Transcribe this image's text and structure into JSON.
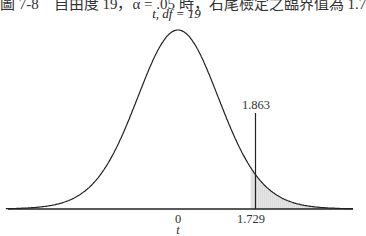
{
  "caption": "圖 7-8　自由度 19，α = .05 時，右尾檢定之臨界值為 1.7",
  "chart_data": {
    "type": "area",
    "title": "t, df = 19",
    "distribution": "Student t",
    "df": 19,
    "xlabel": "t",
    "ylabel": "",
    "tick_labels": [
      "0",
      "1.729"
    ],
    "annotations": [
      {
        "label": "1.863",
        "x": 1.863,
        "kind": "vertical-line"
      },
      {
        "label": "1.729",
        "x": 1.729,
        "kind": "critical-value",
        "shaded_right_tail": true
      }
    ],
    "shaded_region": {
      "from": 1.729,
      "to": "inf",
      "alpha": 0.05
    },
    "grid": false,
    "legend": null
  },
  "labels": {
    "subtitle_t": "t",
    "subtitle_rest": ", df = 19",
    "zero": "0",
    "crit": "1.729",
    "observed": "1.863",
    "xaxis": "t"
  }
}
